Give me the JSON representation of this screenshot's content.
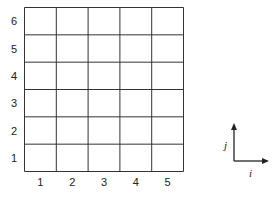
{
  "grid": {
    "columns": 5,
    "rows": 6,
    "x_labels": [
      "1",
      "2",
      "3",
      "4",
      "5"
    ],
    "y_labels": [
      "1",
      "2",
      "3",
      "4",
      "5",
      "6"
    ],
    "line_color": "#333333"
  },
  "axes_indicator": {
    "horizontal_label": "i",
    "vertical_label": "j"
  }
}
